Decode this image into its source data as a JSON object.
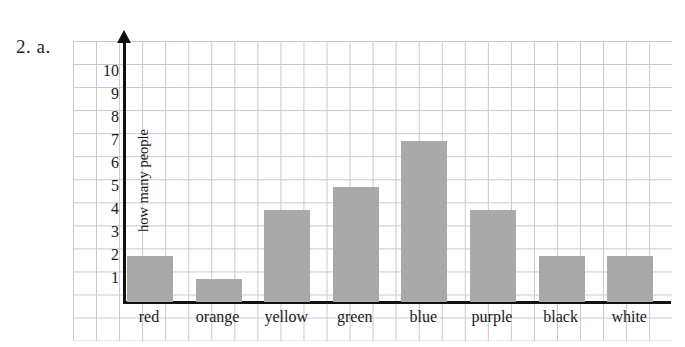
{
  "exercise": {
    "label": "2. a."
  },
  "chart_data": {
    "type": "bar",
    "title": "",
    "subtitle": "",
    "xlabel": "",
    "ylabel": "how many people",
    "categories": [
      "red",
      "orange",
      "yellow",
      "green",
      "blue",
      "purple",
      "black",
      "white"
    ],
    "values": [
      2,
      1,
      4,
      5,
      7,
      4,
      2,
      2
    ],
    "ylim": [
      0,
      10
    ],
    "ytick_labels": [
      "1",
      "2",
      "3",
      "4",
      "5",
      "6",
      "7",
      "8",
      "9",
      "10"
    ],
    "ytick_values": [
      1,
      2,
      3,
      4,
      5,
      6,
      7,
      8,
      9,
      10
    ],
    "grid": true,
    "grid_style": "graph-paper",
    "legend": false,
    "legend_position": "none",
    "bar_color": "#a9a9a9",
    "axis_color": "#111111",
    "grid_color": "#b9c0cc",
    "background_color": "#ffffff"
  }
}
